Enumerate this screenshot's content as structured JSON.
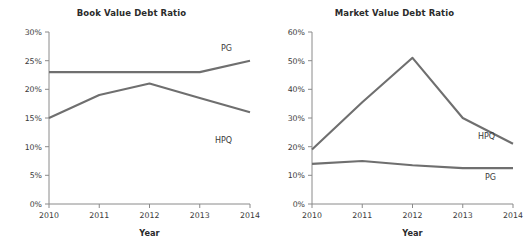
{
  "page": {
    "background_color": "#ffffff",
    "line_color": "#6f6f6f",
    "axis_color": "#8a8a8a",
    "text_color": "#333333"
  },
  "charts": [
    {
      "id": "book-value",
      "title": "Book Value Debt Ratio",
      "xlabel": "Year",
      "ylabel": "",
      "ytick_labels": [
        "0%",
        "5%",
        "10%",
        "15%",
        "20%",
        "25%",
        "30%"
      ],
      "xtick_labels": [
        "2010",
        "2011",
        "2012",
        "2013",
        "2014"
      ],
      "series_labels": [
        {
          "name": "PG",
          "text": "PG"
        },
        {
          "name": "HPQ",
          "text": "HPQ"
        }
      ]
    },
    {
      "id": "market-value",
      "title": "Market Value Debt Ratio",
      "xlabel": "Year",
      "ylabel": "",
      "ytick_labels": [
        "0%",
        "10%",
        "20%",
        "30%",
        "40%",
        "50%",
        "60%"
      ],
      "xtick_labels": [
        "2010",
        "2011",
        "2012",
        "2013",
        "2014"
      ],
      "series_labels": [
        {
          "name": "HPQ",
          "text": "HPQ"
        },
        {
          "name": "PG",
          "text": "PG"
        }
      ]
    }
  ],
  "chart_data": [
    {
      "type": "line",
      "title": "Book Value Debt Ratio",
      "xlabel": "Year",
      "ylabel": "",
      "x": [
        2010,
        2011,
        2012,
        2013,
        2014
      ],
      "categories": [
        "2010",
        "2011",
        "2012",
        "2013",
        "2014"
      ],
      "series": [
        {
          "name": "PG",
          "values": [
            23.0,
            23.0,
            23.0,
            23.0,
            25.0
          ]
        },
        {
          "name": "HPQ",
          "values": [
            15.0,
            19.0,
            21.0,
            18.5,
            16.0
          ]
        }
      ],
      "ylim": [
        0,
        30
      ],
      "yticks": [
        0,
        5,
        10,
        15,
        20,
        25,
        30
      ],
      "ytick_format": "percent",
      "xlim": [
        2010,
        2014
      ],
      "grid": false,
      "legend": "inline-labels",
      "legend_position": "right-of-line-ends"
    },
    {
      "type": "line",
      "title": "Market Value Debt Ratio",
      "xlabel": "Year",
      "ylabel": "",
      "x": [
        2010,
        2011,
        2012,
        2013,
        2014
      ],
      "categories": [
        "2010",
        "2011",
        "2012",
        "2013",
        "2014"
      ],
      "series": [
        {
          "name": "HPQ",
          "values": [
            19.0,
            35.5,
            51.0,
            30.0,
            21.0
          ]
        },
        {
          "name": "PG",
          "values": [
            14.0,
            15.0,
            13.5,
            12.5,
            12.5
          ]
        }
      ],
      "ylim": [
        0,
        60
      ],
      "yticks": [
        0,
        10,
        20,
        30,
        40,
        50,
        60
      ],
      "ytick_format": "percent",
      "xlim": [
        2010,
        2014
      ],
      "grid": false,
      "legend": "inline-labels",
      "legend_position": "right-of-line-ends"
    }
  ]
}
